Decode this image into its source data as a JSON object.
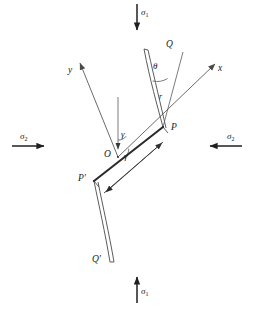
{
  "figure": {
    "background_color": "#ffffff",
    "line_color": "#3a3a3a",
    "crack_color": "#2b2b2b",
    "text_color": "#1a1a1a",
    "width": 255,
    "height": 309
  },
  "loads": {
    "top": {
      "label": "σ",
      "subscript": "1",
      "direction": "down",
      "name": "sigma-1-top"
    },
    "bottom": {
      "label": "σ",
      "subscript": "1",
      "direction": "up",
      "name": "sigma-1-bottom"
    },
    "left": {
      "label": "σ",
      "subscript": "2",
      "direction": "right",
      "name": "sigma-2-left"
    },
    "right": {
      "label": "σ",
      "subscript": "2",
      "direction": "left",
      "name": "sigma-2-right"
    }
  },
  "axes": {
    "x": {
      "label": "x",
      "direction": "up-right"
    },
    "y": {
      "label": "y",
      "direction": "up-left"
    },
    "origin": {
      "label": "O"
    }
  },
  "points": {
    "p": "P",
    "p_prime": "P′",
    "q": "Q",
    "q_prime": "Q′"
  },
  "angles": {
    "gamma": "γ",
    "theta": "θ",
    "gamma_lower": "γ"
  },
  "lengths": {
    "r": "r"
  }
}
